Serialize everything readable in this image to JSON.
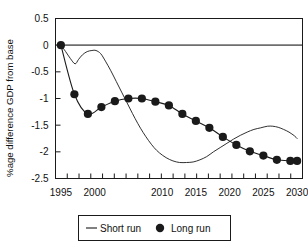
{
  "chart_data": {
    "type": "line",
    "title": "",
    "xlabel": "",
    "ylabel": "%age difference GDP from base",
    "xlim": [
      1994.2,
      2030.8
    ],
    "ylim": [
      -2.5,
      0.5
    ],
    "grid": false,
    "zero_line": true,
    "legend_position": "bottom",
    "y_ticks": [
      0.5,
      0,
      -0.5,
      -1,
      -1.5,
      -2,
      -2.5
    ],
    "y_tick_labels": [
      "0.5",
      "0",
      "-0.5",
      "-1",
      "-1.5",
      "-2",
      "-2.5"
    ],
    "x_ticks": [
      1995,
      1996.7,
      1998.4,
      2000.1,
      2001.8,
      2003.5,
      2005.2,
      2006.9,
      2008.6,
      2010.3,
      2012.0,
      2013.7,
      2015.4,
      2017.1,
      2018.8,
      2020.5,
      2022.2,
      2023.9,
      2025.6,
      2027.3,
      2029.0,
      2030.0
    ],
    "x_tick_labels": [
      {
        "value": 1995,
        "label": "1995"
      },
      {
        "value": 2000,
        "label": "2000"
      },
      {
        "value": 2010,
        "label": "2010"
      },
      {
        "value": 2015,
        "label": "2015"
      },
      {
        "value": 2020,
        "label": "2020"
      },
      {
        "value": 2025,
        "label": "2025"
      },
      {
        "value": 2030,
        "label": "2030"
      }
    ],
    "series": [
      {
        "name": "Short run",
        "style": "line",
        "color": "#1a1a1a",
        "marker": "none",
        "x": [
          1995,
          1995.7,
          1996.4,
          1997.1,
          1997.6,
          1998.2,
          1998.9,
          1999.6,
          2000.2,
          2000.9,
          2001.6,
          2002.4,
          2003.2,
          2004.0,
          2004.8,
          2005.6,
          2006.4,
          2007.2,
          2008.0,
          2008.8,
          2009.6,
          2010.6,
          2011.6,
          2012.6,
          2013.6,
          2014.6,
          2015.6,
          2016.6,
          2017.6,
          2018.6,
          2019.6,
          2020.6,
          2021.6,
          2022.6,
          2023.6,
          2024.6,
          2025.6,
          2026.4,
          2027.2,
          2028.0,
          2028.8,
          2029.6,
          2030.0
        ],
        "y": [
          0.0,
          -0.12,
          -0.25,
          -0.35,
          -0.27,
          -0.18,
          -0.12,
          -0.1,
          -0.1,
          -0.16,
          -0.3,
          -0.48,
          -0.68,
          -0.88,
          -1.08,
          -1.28,
          -1.47,
          -1.64,
          -1.79,
          -1.92,
          -2.02,
          -2.11,
          -2.17,
          -2.2,
          -2.2,
          -2.19,
          -2.15,
          -2.09,
          -2.0,
          -1.92,
          -1.84,
          -1.76,
          -1.69,
          -1.63,
          -1.58,
          -1.55,
          -1.52,
          -1.52,
          -1.54,
          -1.58,
          -1.63,
          -1.7,
          -1.75
        ]
      },
      {
        "name": "Long run",
        "style": "line+marker",
        "color": "#1a1a1a",
        "marker": "circle",
        "x": [
          1995,
          1997,
          1999,
          2001,
          2003,
          2005,
          2007,
          2009,
          2011,
          2013,
          2015,
          2017,
          2019,
          2021,
          2023,
          2025,
          2027,
          2029,
          2030
        ],
        "y": [
          0.0,
          -0.92,
          -1.29,
          -1.16,
          -1.05,
          -1.0,
          -1.0,
          -1.06,
          -1.13,
          -1.29,
          -1.42,
          -1.55,
          -1.72,
          -1.87,
          -1.99,
          -2.07,
          -2.15,
          -2.17,
          -2.17
        ]
      }
    ],
    "legend_items": [
      {
        "label": "Short run",
        "marker": "line"
      },
      {
        "label": "Long run",
        "marker": "circle"
      }
    ]
  },
  "colors": {
    "axis": "#1a1a1a",
    "zero_line": "#6e6e6e",
    "series": "#1a1a1a",
    "background": "#ffffff",
    "legend_border": "#1a1a1a"
  }
}
